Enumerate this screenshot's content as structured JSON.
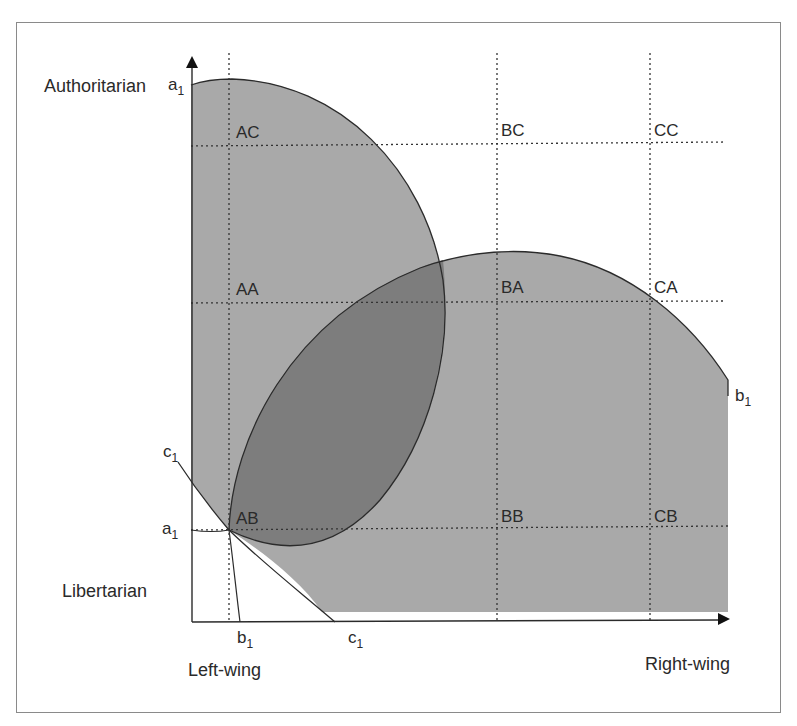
{
  "diagram": {
    "type": "ideological-space",
    "axes": {
      "y_top_label": "Authoritarian",
      "y_bottom_label": "Libertarian",
      "x_left_label": "Left-wing",
      "x_right_label": "Right-wing"
    },
    "curve_labels": {
      "a_top": {
        "base": "a",
        "sub": "1"
      },
      "a_left": {
        "base": "a",
        "sub": "1"
      },
      "b_bottom": {
        "base": "b",
        "sub": "1"
      },
      "b_right": {
        "base": "b",
        "sub": "1"
      },
      "c_left": {
        "base": "c",
        "sub": "1"
      },
      "c_bottom": {
        "base": "c",
        "sub": "1"
      }
    },
    "cells": {
      "AC": "AC",
      "BC": "BC",
      "CC": "CC",
      "AA": "AA",
      "BA": "BA",
      "CA": "CA",
      "AB": "AB",
      "BB": "BB",
      "CB": "CB"
    },
    "colors": {
      "region_fill": "#a9a9a9",
      "overlap_fill": "#7d7d7d",
      "line": "#2b2b2b",
      "frame": "#8a8a8a"
    }
  }
}
